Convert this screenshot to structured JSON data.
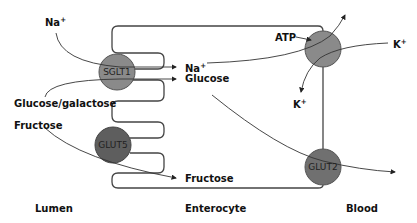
{
  "diagram": {
    "regions": {
      "lumen": "Lumen",
      "enterocyte": "Enterocyte",
      "blood": "Blood"
    },
    "transporters": {
      "sglt1": "SGLT1",
      "glut5": "GLUT5",
      "glut2": "GLUT2",
      "pump": ""
    },
    "labels": {
      "na_lumen": "Na",
      "na_lumen_sup": "+",
      "na_cell": "Na",
      "na_cell_sup": "+",
      "glucose_galactose": "Glucose/galactose",
      "glucose_cell": "Glucose",
      "fructose_lumen": "Fructose",
      "fructose_cell": "Fructose",
      "atp": "ATP",
      "k_blood": "K",
      "k_blood_sup": "+",
      "k_cell": "K",
      "k_cell_sup": "+"
    },
    "colors": {
      "transporter_fill": "#8a8a8a",
      "glut5_fill": "#5e5e5e",
      "glut2_fill": "#707070",
      "line": "#444444"
    }
  }
}
